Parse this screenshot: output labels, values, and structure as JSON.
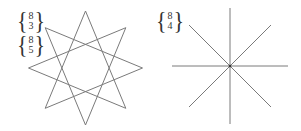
{
  "figures": [
    {
      "id": "octagram-8-3",
      "labels": [
        {
          "top": "8",
          "bottom": "3"
        },
        {
          "top": "8",
          "bottom": "5"
        }
      ],
      "center": [
        85.5,
        68
      ],
      "radius": 57,
      "n": 8,
      "step": 3
    },
    {
      "id": "degenerate-8-4",
      "labels": [
        {
          "top": "8",
          "bottom": "4"
        }
      ],
      "center": [
        230,
        66
      ],
      "radius": 58,
      "n": 8,
      "step": 4
    }
  ],
  "colors": {
    "stroke": "#7a7a7a",
    "text": "#333333"
  }
}
